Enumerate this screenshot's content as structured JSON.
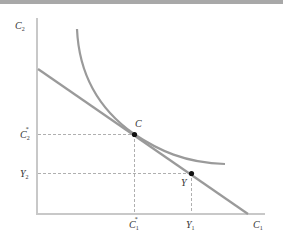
{
  "diagram": {
    "colors": {
      "axis": "#c8c8c8",
      "curve": "#9a9a9a",
      "budget_line": "#9a9a9a",
      "guide": "#9a9a9a",
      "point": "#111111",
      "topbar": "#a8a8a8",
      "text": "#333333"
    },
    "axes": {
      "x_label": {
        "base": "C",
        "sub": "1"
      },
      "y_label": {
        "base": "C",
        "sub": "2"
      }
    },
    "points": [
      {
        "id": "C",
        "label": "C",
        "x_tick": {
          "base": "C",
          "sub": "1",
          "sup": "*"
        },
        "y_tick": {
          "base": "C",
          "sub": "2",
          "sup": "*"
        }
      },
      {
        "id": "Y",
        "label": "Y",
        "x_tick": {
          "base": "Y",
          "sub": "1",
          "sup": ""
        },
        "y_tick": {
          "base": "Y",
          "sub": "2",
          "sup": ""
        }
      }
    ],
    "curves": [
      {
        "id": "indifference-curve",
        "kind": "convex curve tangent to budget line at C"
      },
      {
        "id": "budget-line",
        "kind": "straight line through C and Y"
      }
    ]
  }
}
